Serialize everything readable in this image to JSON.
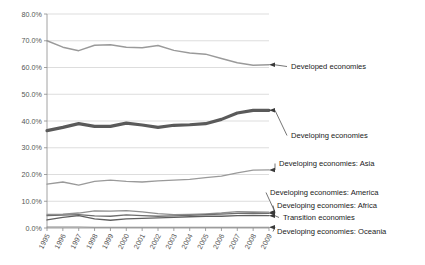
{
  "chart_data": {
    "type": "line",
    "title": "",
    "subtitle": "",
    "xlabel": "",
    "ylabel": "",
    "grid": true,
    "legend_position": "right-annotations",
    "ylim": [
      0,
      80
    ],
    "ytick_labels": [
      "80.0%",
      "70.0%",
      "60.0%",
      "50.0%",
      "40.0%",
      "30.0%",
      "20.0%",
      "10.0%",
      "0.0%"
    ],
    "ytick_values": [
      80,
      70,
      60,
      50,
      40,
      30,
      20,
      10,
      0
    ],
    "categories": [
      "1995",
      "1996",
      "1997",
      "1998",
      "1999",
      "2000",
      "2001",
      "2002",
      "2003",
      "2004",
      "2005",
      "2006",
      "2007",
      "2008",
      "2009"
    ],
    "series": [
      {
        "name": "Developed economies",
        "color": "#9a9a9a",
        "width": 1.5,
        "values": [
          70.0,
          67.6,
          66.3,
          68.3,
          68.5,
          67.6,
          67.4,
          68.2,
          66.4,
          65.4,
          65.0,
          63.4,
          61.8,
          60.8,
          61.0
        ]
      },
      {
        "name": "Developing economies",
        "color": "#5a5a5a",
        "width": 3.2,
        "values": [
          36.4,
          37.6,
          39.0,
          38.0,
          38.0,
          39.2,
          38.5,
          37.6,
          38.4,
          38.6,
          39.0,
          40.6,
          43.0,
          44.0,
          44.0
        ]
      },
      {
        "name": "Developing economies: Asia",
        "color": "#9a9a9a",
        "width": 1.3,
        "values": [
          16.4,
          17.2,
          16.0,
          17.4,
          17.9,
          17.4,
          17.2,
          17.6,
          17.9,
          18.2,
          18.8,
          19.4,
          20.6,
          21.6,
          21.7
        ]
      },
      {
        "name": "Developing economies: America",
        "color": "#8f8f8f",
        "width": 1.3,
        "values": [
          5.1,
          5.2,
          5.6,
          6.4,
          6.3,
          6.5,
          6.0,
          5.4,
          5.0,
          5.1,
          5.3,
          5.6,
          6.1,
          6.0,
          5.9
        ]
      },
      {
        "name": "Developing economies: Africa",
        "color": "#6e6e6e",
        "width": 1.3,
        "values": [
          4.6,
          4.8,
          5.0,
          4.5,
          4.4,
          4.9,
          4.6,
          4.4,
          4.5,
          4.7,
          5.0,
          5.2,
          5.5,
          5.6,
          5.5
        ]
      },
      {
        "name": "Transition economies",
        "color": "#5f5f5f",
        "width": 1.3,
        "values": [
          3.0,
          4.0,
          4.6,
          3.4,
          2.9,
          3.4,
          3.6,
          3.8,
          4.0,
          4.2,
          4.4,
          4.4,
          4.6,
          4.7,
          4.6
        ]
      },
      {
        "name": "Developing economies: Oceania",
        "color": "#8a8a8a",
        "width": 1.1,
        "values": [
          0.35,
          0.35,
          0.35,
          0.3,
          0.3,
          0.3,
          0.3,
          0.3,
          0.3,
          0.3,
          0.3,
          0.3,
          0.3,
          0.3,
          0.3
        ]
      }
    ],
    "annotations": [
      {
        "text": "Developed economies",
        "series": "Developed economies"
      },
      {
        "text": "Developing economies",
        "series": "Developing economies"
      },
      {
        "text": "Developing economies: Asia",
        "series": "Developing economies: Asia"
      },
      {
        "text": "Developing economies: America",
        "series": "Developing economies: America"
      },
      {
        "text": "Developing economies: Africa",
        "series": "Developing economies: Africa"
      },
      {
        "text": "Transition economies",
        "series": "Transition economies"
      },
      {
        "text": "Developing economies: Oceania",
        "series": "Developing economies: Oceania"
      }
    ]
  }
}
